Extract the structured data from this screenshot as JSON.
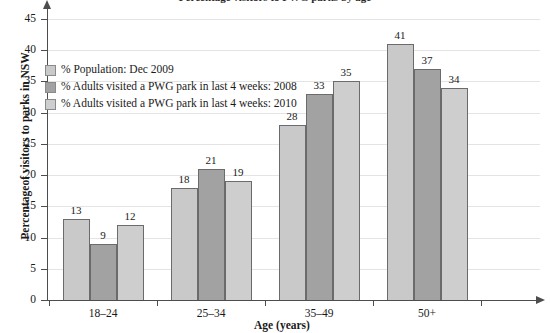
{
  "chart_data": {
    "type": "bar",
    "title": "Percentage visitors to PWG parks by age",
    "xlabel": "Age (years)",
    "ylabel": "Percentageof visitors to parks in NSW",
    "categories": [
      "18–24",
      "25–34",
      "35–49",
      "50+"
    ],
    "series": [
      {
        "name": "% Population: Dec 2009",
        "color": "#c9c9c9",
        "values": [
          13,
          18,
          28,
          41
        ]
      },
      {
        "name": "% Adults visited a PWG park in last 4 weeks: 2008",
        "color": "#a2a2a2",
        "values": [
          9,
          21,
          33,
          37
        ]
      },
      {
        "name": "% Adults visited a PWG park in last 4 weeks: 2010",
        "color": "#cecece",
        "values": [
          12,
          19,
          35,
          34
        ]
      }
    ],
    "ylim": [
      0,
      45
    ],
    "ytick_step": 5,
    "yticks": [
      0,
      5,
      10,
      15,
      20,
      25,
      30,
      35,
      40,
      45
    ],
    "ytick_labels": [
      "0",
      "5",
      "10",
      "15",
      "20",
      "25",
      "30",
      "35",
      "40",
      "45"
    ],
    "grid": true,
    "legend_position": "upper left",
    "bar_border_color": "#6b6b6b",
    "axis_color": "#4d4d4d",
    "gridline_color": "#e4e4e4"
  },
  "legend": {
    "items": [
      {
        "label": "% Population: Dec 2009"
      },
      {
        "label": "% Adults visited a PWG park in last 4 weeks: 2008"
      },
      {
        "label": "% Adults visited a PWG park in last 4 weeks: 2010"
      }
    ]
  }
}
